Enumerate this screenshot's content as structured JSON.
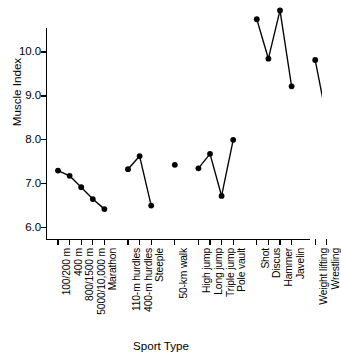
{
  "chart_data": {
    "type": "scatter",
    "title": "",
    "xlabel": "Sport Type",
    "ylabel": "Muscle Index",
    "ylim": [
      5.75,
      10.55
    ],
    "yticks": [
      "6.0",
      "7.0",
      "8.0",
      "9.0",
      "10.0"
    ],
    "ytick_values": [
      6.0,
      7.0,
      8.0,
      9.0,
      10.0
    ],
    "grid": false,
    "legend": "none",
    "note": "Points within each sport group are connected by line segments; Shot and Hammer exceed the top of the visible axis and their connecting lines are clipped.",
    "categories": [
      "100/200 m",
      "400 m",
      "800/1500 m",
      "5000/10,000 m",
      "Marathon",
      "110-m hurdles",
      "400-m hurdles",
      "Steeple",
      "50-km walk",
      "High jump",
      "Long jump",
      "Triple jump",
      "Pole vault",
      "Shot",
      "Discus",
      "Hammer",
      "Javelin",
      "Weight lifting",
      "Wrestling"
    ],
    "values": [
      7.3,
      7.18,
      6.92,
      6.65,
      6.42,
      7.33,
      7.63,
      6.5,
      7.43,
      7.35,
      7.68,
      6.72,
      8.0,
      10.75,
      9.85,
      10.95,
      9.22,
      9.82,
      8.47
    ],
    "groups": [
      {
        "name": "Track running",
        "indices": [
          0,
          1,
          2,
          3,
          4
        ]
      },
      {
        "name": "Hurdles",
        "indices": [
          5,
          6,
          7
        ]
      },
      {
        "name": "Walk",
        "indices": [
          8
        ]
      },
      {
        "name": "Jumps",
        "indices": [
          9,
          10,
          11,
          12
        ]
      },
      {
        "name": "Throws",
        "indices": [
          13,
          14,
          15,
          16
        ]
      },
      {
        "name": "Strength",
        "indices": [
          17,
          18
        ]
      }
    ],
    "clipped_points": [
      "Shot",
      "Hammer"
    ]
  }
}
